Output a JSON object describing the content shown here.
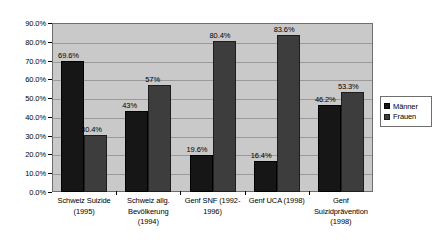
{
  "chart_data": {
    "type": "bar",
    "title": "",
    "subtitle": "",
    "xlabel": "",
    "ylabel": "",
    "ylim": [
      0,
      90
    ],
    "ytick_step": 10,
    "grid": true,
    "grid_axis": "y",
    "legend_position": "right",
    "value_labels": true,
    "categories": [
      "Schweiz Suizide (1995)",
      "Schweiz allg. Bevölkerung (1994)",
      "Genf SNF (1992-1996)",
      "Genf UCA (1998)",
      "Genf Suizidprävention (1998)"
    ],
    "category_lines": [
      [
        "Schweiz Suizide",
        "(1995)"
      ],
      [
        "Schweiz allg.",
        "Bevölkerung",
        "(1994)"
      ],
      [
        "Genf SNF (1992-",
        "1996)"
      ],
      [
        "Genf UCA (1998)"
      ],
      [
        "Genf",
        "Suizidprävention",
        "(1998)"
      ]
    ],
    "ytick_labels": [
      "0.0%",
      "10.0%",
      "20.0%",
      "30.0%",
      "40.0%",
      "50.0%",
      "60.0%",
      "70.0%",
      "80.0%",
      "90.0%"
    ],
    "ytick_values": [
      0,
      10,
      20,
      30,
      40,
      50,
      60,
      70,
      80,
      90
    ],
    "series": [
      {
        "name": "Männer",
        "color": "#161616",
        "values": [
          69.6,
          43,
          19.6,
          16.4,
          46.2
        ],
        "labels": [
          "69.6%",
          "43%",
          "19.6%",
          "16.4%",
          "46.2%"
        ]
      },
      {
        "name": "Frauen",
        "color": "#3d3d3d",
        "values": [
          30.4,
          57,
          80.4,
          83.6,
          53.3
        ],
        "labels": [
          "30.4%",
          "57%",
          "80.4%",
          "83.6%",
          "53.3%"
        ]
      }
    ]
  },
  "legend": {
    "items": [
      {
        "label": "Männer",
        "swatch_class": "maenner"
      },
      {
        "label": "Frauen",
        "swatch_class": "frauen"
      }
    ]
  }
}
